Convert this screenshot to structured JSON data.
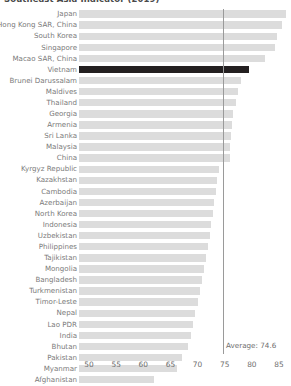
{
  "chart_title": "Southeast Asia Indicator (2019)",
  "average_label": "Average: 74.6",
  "chart_data": {
    "type": "bar",
    "orientation": "horizontal",
    "title": "Southeast Asia Indicator (2019)",
    "xlabel": "",
    "ylabel": "",
    "xlim": [
      48.2,
      86.5
    ],
    "xticks": [
      50,
      55,
      60,
      65,
      70,
      75,
      80,
      85
    ],
    "grid": false,
    "bar_color": "#dcdcdc",
    "highlight_color": "#231f20",
    "highlight_category": "Vietnam",
    "reference_line": {
      "value": 74.6,
      "label": "Average: 74.6",
      "color": "#9a9a9a"
    },
    "categories": [
      "Japan",
      "Hong Kong SAR, China",
      "South Korea",
      "Singapore",
      "Macao SAR, China",
      "Vietnam",
      "Brunei Darussalam",
      "Maldives",
      "Thailand",
      "Georgia",
      "Armenia",
      "Sri Lanka",
      "Malaysia",
      "China",
      "Kyrgyz Republic",
      "Kazakhstan",
      "Cambodia",
      "Azerbaijan",
      "North Korea",
      "Indonesia",
      "Uzbekistan",
      "Philippines",
      "Tajikistan",
      "Mongolia",
      "Bangladesh",
      "Turkmenistan",
      "Timor-Leste",
      "Nepal",
      "Lao PDR",
      "India",
      "Bhutan",
      "Pakistan",
      "Myanmar",
      "Afghanistan"
    ],
    "values": [
      86.2,
      85.6,
      84.6,
      84.2,
      82.5,
      79.5,
      78.0,
      77.4,
      77.1,
      76.6,
      76.4,
      76.2,
      76.0,
      75.9,
      74.0,
      73.6,
      73.4,
      73.1,
      72.8,
      72.5,
      72.3,
      71.9,
      71.6,
      71.2,
      70.9,
      70.5,
      70.0,
      69.6,
      69.2,
      68.8,
      68.3,
      67.1,
      66.2,
      62.0
    ]
  },
  "x_ticks": [
    "50",
    "55",
    "60",
    "65",
    "70",
    "75",
    "80",
    "85"
  ]
}
